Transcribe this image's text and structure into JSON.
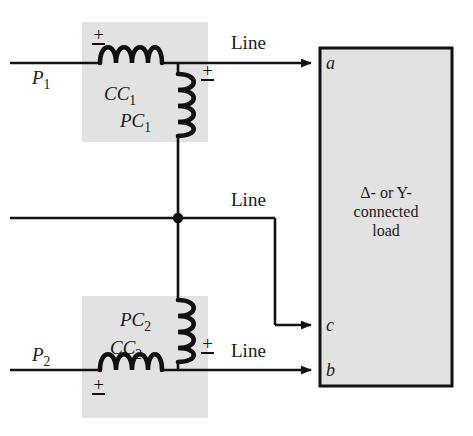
{
  "figure": {
    "type": "two-wattmeter-method-circuit-diagram",
    "background_color": "#ffffff",
    "wire_color": "#111111",
    "shade_color": "#e2e2e2"
  },
  "sources": [
    {
      "name": "source-label-p1",
      "label": "P",
      "subscript": "1"
    },
    {
      "name": "source-label-p2",
      "label": "P",
      "subscript": "2"
    }
  ],
  "wattmeters": [
    {
      "id": "wattmeter-1",
      "current_coil": {
        "label": "CC",
        "subscript": "1"
      },
      "potential_coil": {
        "label": "PC",
        "subscript": "1"
      },
      "cc_polarity": "±",
      "pc_polarity": "±"
    },
    {
      "id": "wattmeter-2",
      "current_coil": {
        "label": "CC",
        "subscript": "2"
      },
      "potential_coil": {
        "label": "PC",
        "subscript": "2"
      },
      "cc_polarity": "±",
      "pc_polarity": "±"
    }
  ],
  "lines": [
    {
      "id": "line-top",
      "label": "Line",
      "terminal": "a"
    },
    {
      "id": "line-middle",
      "label": "Line",
      "terminal": "c"
    },
    {
      "id": "line-bottom",
      "label": "Line",
      "terminal": "b"
    }
  ],
  "terminals": [
    {
      "id": "terminal-a",
      "label": "a"
    },
    {
      "id": "terminal-c",
      "label": "c"
    },
    {
      "id": "terminal-b",
      "label": "b"
    }
  ],
  "load": {
    "id": "load-block",
    "line1": "Δ- or Y-",
    "line2": "connected",
    "line3": "load",
    "fill_color": "#e2e2e2",
    "border_color": "#111111"
  },
  "junction": {
    "id": "wire-junction-dot",
    "present": true
  }
}
